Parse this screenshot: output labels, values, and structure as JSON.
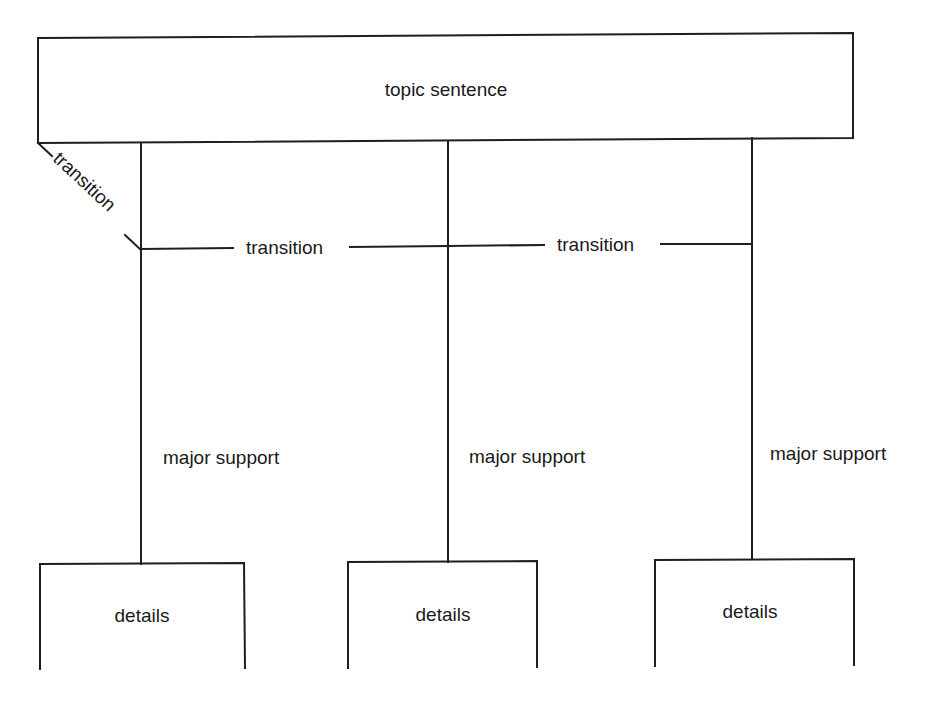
{
  "diagram": {
    "colors": {
      "line": "#1f1f1f",
      "text": "#1a1a1a",
      "background": "#ffffff"
    },
    "top_box": {
      "label": "topic sentence"
    },
    "diagonal_transition": {
      "label": "transition"
    },
    "horizontal_transitions": [
      {
        "label": "transition"
      },
      {
        "label": "transition"
      }
    ],
    "branches": [
      {
        "support_label": "major support",
        "details_label": "details"
      },
      {
        "support_label": "major support",
        "details_label": "details"
      },
      {
        "support_label": "major support",
        "details_label": "details"
      }
    ]
  }
}
